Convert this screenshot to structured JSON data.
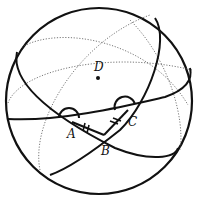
{
  "diagram": {
    "type": "sphere with great circles (spherical triangle)",
    "points": {
      "A": "A",
      "B": "B",
      "C": "C",
      "D": "D"
    },
    "marks": {
      "equal_segments": [
        "AB",
        "BC"
      ],
      "tick_count": 2,
      "angle_arcs": [
        "A",
        "C"
      ]
    }
  }
}
